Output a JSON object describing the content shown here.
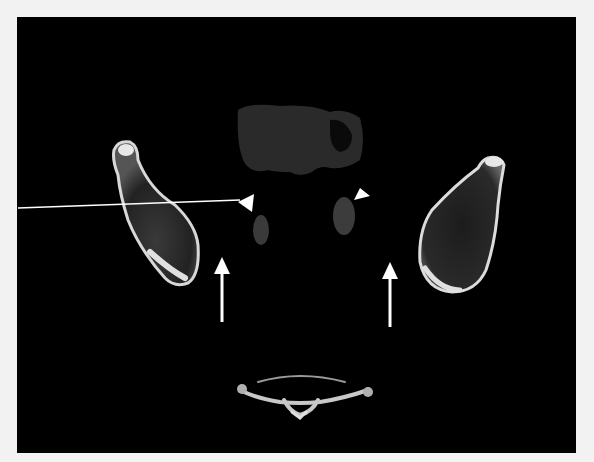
{
  "image": {
    "type": "axial CT scan",
    "background": "#000000",
    "border_color": "#f2f2f2"
  },
  "annotations": {
    "arrowheads": [
      {
        "name": "left-arrowhead",
        "x": 246,
        "y": 203,
        "color": "#ffffff"
      },
      {
        "name": "right-arrowhead",
        "x": 361,
        "y": 198,
        "color": "#ffffff"
      }
    ],
    "arrows": [
      {
        "name": "left-arrow",
        "x": 222,
        "y_top": 257,
        "y_bottom": 322,
        "direction": "up",
        "color": "#ffffff"
      },
      {
        "name": "right-arrow",
        "x": 390,
        "y_top": 262,
        "y_bottom": 327,
        "direction": "up",
        "color": "#ffffff"
      }
    ],
    "pointer_line": {
      "x1": 18,
      "y1": 208,
      "x2": 246,
      "y2": 199,
      "color": "#ffffff"
    }
  },
  "structures": [
    {
      "name": "left-bone"
    },
    {
      "name": "right-bone"
    },
    {
      "name": "left-soft-tissue-oval"
    },
    {
      "name": "right-soft-tissue-oval"
    },
    {
      "name": "upper-soft-tissue-mass"
    },
    {
      "name": "vertebra"
    }
  ]
}
